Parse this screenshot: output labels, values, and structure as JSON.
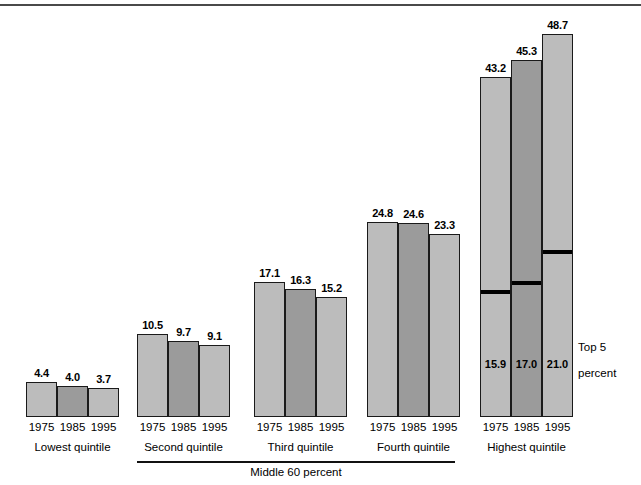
{
  "chart_data": {
    "type": "bar",
    "title": "",
    "subtitle": "",
    "xlabel": "",
    "ylabel": "",
    "ylim": [
      0,
      48.7
    ],
    "grid": false,
    "legend_position": "none",
    "categories": [
      "Lowest quintile",
      "Second quintile",
      "Third quintile",
      "Fourth quintile",
      "Highest quintile"
    ],
    "x": [
      "1975",
      "1985",
      "1995"
    ],
    "series": [
      {
        "name": "1975",
        "values": [
          4.4,
          10.5,
          17.1,
          24.8,
          43.2
        ]
      },
      {
        "name": "1985",
        "values": [
          4.0,
          9.7,
          16.3,
          24.6,
          45.3
        ]
      },
      {
        "name": "1995",
        "values": [
          3.7,
          9.1,
          15.2,
          23.3,
          48.7
        ]
      }
    ],
    "annotations": {
      "top5_percent": {
        "label": "Top 5\npercent",
        "values": [
          15.9,
          17.0,
          21.0
        ],
        "years": [
          "1975",
          "1985",
          "1995"
        ],
        "applies_to": "Highest quintile"
      },
      "bracket": {
        "label": "Middle 60 percent",
        "spans": [
          "Second quintile",
          "Third quintile",
          "Fourth quintile"
        ]
      }
    }
  },
  "colors": {
    "bar_1975": "#bcbcbc",
    "bar_1985": "#9b9b9b",
    "bar_1995": "#bcbcbc",
    "bar_outline": "#1a1a1a",
    "top5_line": "#000000",
    "text": "#000000",
    "background": "#ffffff"
  },
  "groups": [
    {
      "name": "Lowest quintile",
      "bars": [
        {
          "year": "1975",
          "value": "4.4"
        },
        {
          "year": "1985",
          "value": "4.0"
        },
        {
          "year": "1995",
          "value": "3.7"
        }
      ]
    },
    {
      "name": "Second quintile",
      "bars": [
        {
          "year": "1975",
          "value": "10.5"
        },
        {
          "year": "1985",
          "value": "9.7"
        },
        {
          "year": "1995",
          "value": "9.1"
        }
      ]
    },
    {
      "name": "Third quintile",
      "bars": [
        {
          "year": "1975",
          "value": "17.1"
        },
        {
          "year": "1985",
          "value": "16.3"
        },
        {
          "year": "1995",
          "value": "15.2"
        }
      ]
    },
    {
      "name": "Fourth quintile",
      "bars": [
        {
          "year": "1975",
          "value": "24.8"
        },
        {
          "year": "1985",
          "value": "24.6"
        },
        {
          "year": "1995",
          "value": "23.3"
        }
      ]
    },
    {
      "name": "Highest quintile",
      "bars": [
        {
          "year": "1975",
          "value": "43.2",
          "top5": "15.9"
        },
        {
          "year": "1985",
          "value": "45.3",
          "top5": "17.0"
        },
        {
          "year": "1995",
          "value": "48.7",
          "top5": "21.0"
        }
      ]
    }
  ],
  "labels": {
    "middle_bracket": "Middle 60 percent",
    "top5_line1": "Top 5",
    "top5_line2": "percent"
  }
}
